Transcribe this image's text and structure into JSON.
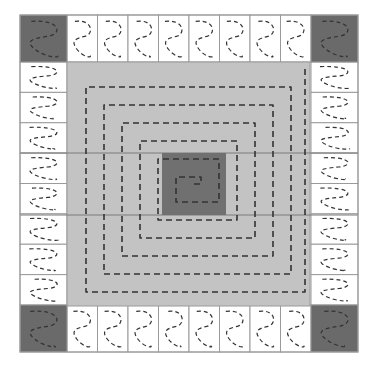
{
  "diagram": {
    "title": "",
    "grid": {
      "left": 20,
      "top": 15,
      "right": 358,
      "bottom": 352,
      "corner_size": 47,
      "edge_cells_per_side": 8
    },
    "colors": {
      "background": "#ffffff",
      "edge_cell": "#ffffff",
      "corner_cell": "#6a6a6a",
      "inner_region": "#c3c3c3",
      "center_square": "#707070",
      "grid_line": "#9a9a9a",
      "dash_line": "#333333"
    },
    "inner_region": {
      "x": 67,
      "y": 62,
      "w": 243,
      "h": 244
    },
    "center_square": {
      "x": 162,
      "y": 153,
      "w": 64,
      "h": 62
    },
    "inner_lines_y": [
      153,
      215
    ],
    "corners": [
      "top-left",
      "top-right",
      "bottom-left",
      "bottom-right"
    ],
    "spiral_label": "dashed square spiral path",
    "edge_path_label": "dashed meandering path in each edge cell"
  }
}
